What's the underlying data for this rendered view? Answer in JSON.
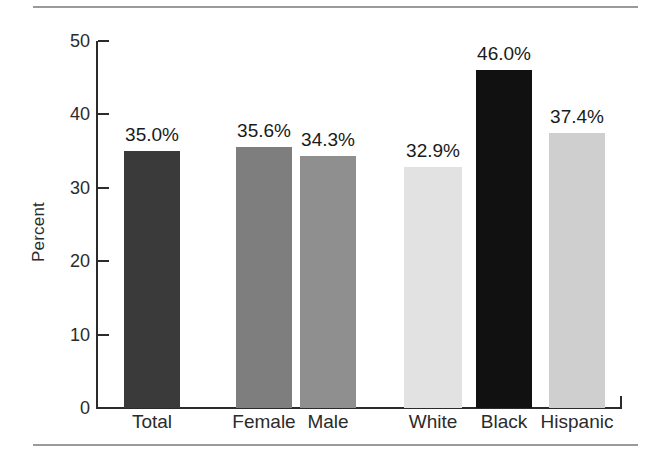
{
  "figure": {
    "rules": {
      "top": true,
      "bottom": true,
      "color": "#9a9a9a"
    },
    "background": "#ffffff"
  },
  "chart_data": {
    "type": "bar",
    "title": "",
    "subtitle": "",
    "xlabel": "",
    "ylabel": "Percent",
    "ylim": [
      0,
      50
    ],
    "yticks": [
      0,
      10,
      20,
      30,
      40,
      50
    ],
    "ytick_labels": [
      "0",
      "10",
      "20",
      "30",
      "40",
      "50"
    ],
    "grid": false,
    "legend": null,
    "categories": [
      "Total",
      "Female",
      "Male",
      "White",
      "Black",
      "Hispanic"
    ],
    "values": [
      35.0,
      35.6,
      34.3,
      32.9,
      46.0,
      37.4
    ],
    "data_labels": [
      "35.0%",
      "35.6%",
      "34.3%",
      "32.9%",
      "46.0%",
      "37.4%"
    ],
    "bar_colors": [
      "#3a3a3a",
      "#7e7e7e",
      "#8f8f8f",
      "#e2e2e2",
      "#111111",
      "#cfcfcf"
    ],
    "groups": [
      {
        "name": "overall",
        "categories": [
          "Total"
        ]
      },
      {
        "name": "sex",
        "categories": [
          "Female",
          "Male"
        ]
      },
      {
        "name": "race-ethnicity",
        "categories": [
          "White",
          "Black",
          "Hispanic"
        ]
      }
    ]
  }
}
